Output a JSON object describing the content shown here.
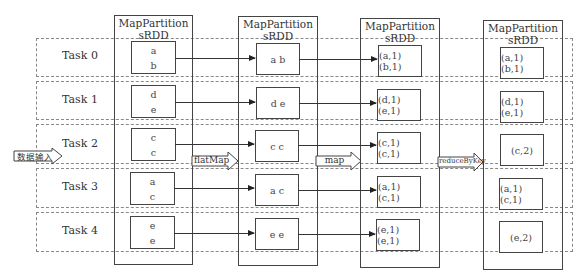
{
  "diagram": {
    "input_label": "数据输入",
    "columns": [
      {
        "title_line1": "MapPartition",
        "title_line2": "sRDD"
      },
      {
        "title_line1": "MapPartition",
        "title_line2": "sRDD"
      },
      {
        "title_line1": "MapPartition",
        "title_line2": "sRDD"
      },
      {
        "title_line1": "MapPartition",
        "title_line2": "sRDD"
      }
    ],
    "transitions": [
      {
        "label": "flatMap"
      },
      {
        "label": "map"
      },
      {
        "label": "reduceByKey"
      }
    ],
    "tasks": [
      {
        "label": "Task 0",
        "input": [
          "a",
          "b"
        ],
        "flatmap": "a b",
        "map": "(a,1)(b,1)",
        "reduce": "(a,1)(b,1)"
      },
      {
        "label": "Task 1",
        "input": [
          "d",
          "e"
        ],
        "flatmap": "d e",
        "map": "(d,1)(e,1)",
        "reduce": "(d,1)(e,1)"
      },
      {
        "label": "Task 2",
        "input": [
          "c",
          "c"
        ],
        "flatmap": "c c",
        "map": "(c,1)(c,1)",
        "reduce": "(c,2)"
      },
      {
        "label": "Task 3",
        "input": [
          "a",
          "c"
        ],
        "flatmap": "a c",
        "map": "(a,1)(c,1)",
        "reduce": "(a,1)(c,1)"
      },
      {
        "label": "Task 4",
        "input": [
          "e",
          "e"
        ],
        "flatmap": "e e",
        "map": "(e,1)(e,1)",
        "reduce": "(e,2)"
      }
    ]
  }
}
